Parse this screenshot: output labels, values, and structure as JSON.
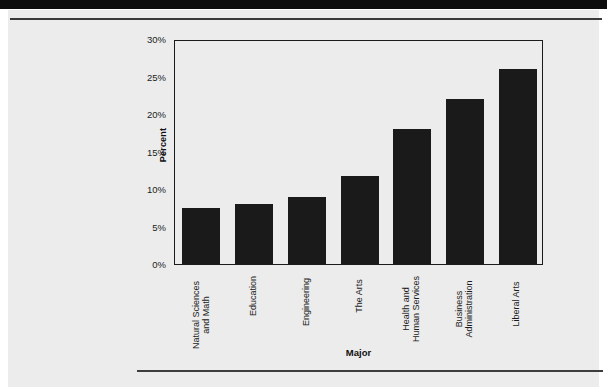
{
  "page": {
    "background_color": "#ececec",
    "band_color": "#0d0d0d",
    "rule_color": "#3a3a3a"
  },
  "chart_data": {
    "type": "bar",
    "title": "",
    "xlabel": "Major",
    "ylabel": "Percent",
    "categories": [
      "Natural Sciences\nand Math",
      "Education",
      "Engineering",
      "The Arts",
      "Health and\nHuman Services",
      "Business\nAdministration",
      "Liberal Arts"
    ],
    "values": [
      7.5,
      8.0,
      9.0,
      11.8,
      18.0,
      22.0,
      26.0
    ],
    "ylim": [
      0,
      30
    ],
    "yticks": [
      0,
      5,
      10,
      15,
      20,
      25,
      30
    ],
    "ytick_labels": [
      "0%",
      "5%",
      "10%",
      "15%",
      "20%",
      "25%",
      "30%"
    ],
    "grid": false,
    "legend": null,
    "bar_color": "#1a1a1a",
    "frame_color": "#1b1b1b"
  }
}
